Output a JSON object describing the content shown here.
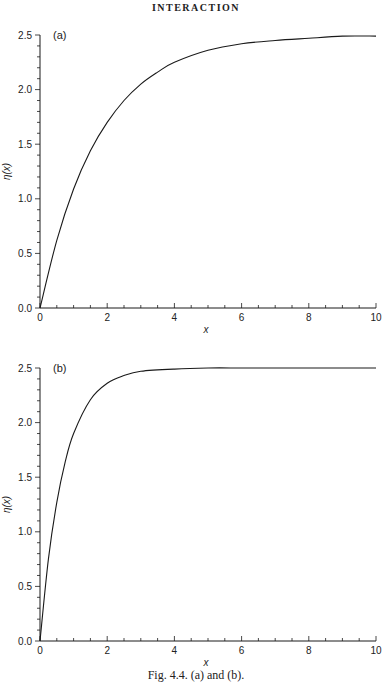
{
  "header": {
    "title": "INTERACTION"
  },
  "caption": "Fig. 4.4. (a) and (b).",
  "chart_data": [
    {
      "type": "line",
      "panel_label": "(a)",
      "title": "",
      "xlabel": "x",
      "ylabel": "η(x)",
      "xlim": [
        0,
        10
      ],
      "ylim": [
        0,
        2.5
      ],
      "xticks": [
        "0",
        "2",
        "4",
        "6",
        "8",
        "10"
      ],
      "yticks": [
        "0.0",
        "0.5",
        "1.0",
        "1.5",
        "2.0",
        "2.5"
      ],
      "grid": false,
      "legend": null,
      "series": [
        {
          "name": "η(x)",
          "x": [
            0,
            0.5,
            1,
            1.5,
            2,
            2.5,
            3,
            3.5,
            4,
            5,
            6,
            7,
            8,
            9,
            10
          ],
          "values": [
            0,
            0.62,
            1.09,
            1.44,
            1.7,
            1.9,
            2.05,
            2.16,
            2.25,
            2.36,
            2.42,
            2.45,
            2.47,
            2.49,
            2.49
          ]
        }
      ]
    },
    {
      "type": "line",
      "panel_label": "(b)",
      "title": "",
      "xlabel": "x",
      "ylabel": "η(x)",
      "xlim": [
        0,
        10
      ],
      "ylim": [
        0,
        2.5
      ],
      "xticks": [
        "0",
        "2",
        "4",
        "6",
        "8",
        "10"
      ],
      "yticks": [
        "0.0",
        "0.5",
        "1.0",
        "1.5",
        "2.0",
        "2.5"
      ],
      "grid": false,
      "legend": null,
      "series": [
        {
          "name": "η(x)",
          "x": [
            0,
            0.25,
            0.5,
            0.75,
            1,
            1.5,
            2,
            2.5,
            3,
            4,
            5,
            6,
            7,
            8,
            9,
            10
          ],
          "values": [
            0,
            0.75,
            1.27,
            1.64,
            1.9,
            2.21,
            2.36,
            2.43,
            2.47,
            2.49,
            2.5,
            2.5,
            2.5,
            2.5,
            2.5,
            2.5
          ]
        }
      ]
    }
  ]
}
